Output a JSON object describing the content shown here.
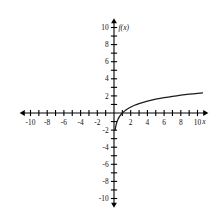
{
  "chart_data": {
    "type": "line",
    "title": "",
    "subtitle": "",
    "xlabel": "x",
    "ylabel": "f(x)",
    "function_label": "f(x)",
    "function_expression": "ln(x)",
    "xlim": [
      -10.8,
      10.8
    ],
    "ylim": [
      -10.6,
      10.6
    ],
    "grid": false,
    "legend": "none",
    "axis_arrows": [
      "left",
      "right",
      "up",
      "down"
    ],
    "tick_interval": 1,
    "label_interval": 2,
    "x_tick_values": [
      -10,
      -9,
      -8,
      -7,
      -6,
      -5,
      -4,
      -3,
      -2,
      -1,
      1,
      2,
      3,
      4,
      5,
      6,
      7,
      8,
      9,
      10
    ],
    "y_tick_values": [
      -10,
      -9,
      -8,
      -7,
      -6,
      -5,
      -4,
      -3,
      -2,
      -1,
      1,
      2,
      3,
      4,
      5,
      6,
      7,
      8,
      9,
      10
    ],
    "x_tick_labels": [
      {
        "value": -10,
        "text": "-10"
      },
      {
        "value": -8,
        "text": "-8"
      },
      {
        "value": -6,
        "text": "-6"
      },
      {
        "value": -4,
        "text": "-4"
      },
      {
        "value": -2,
        "text": "-2"
      },
      {
        "value": 2,
        "text": "2"
      },
      {
        "value": 4,
        "text": "4"
      },
      {
        "value": 6,
        "text": "6"
      },
      {
        "value": 8,
        "text": "8"
      },
      {
        "value": 10,
        "text": "10"
      }
    ],
    "y_tick_labels": [
      {
        "value": 10,
        "text": "10"
      },
      {
        "value": 8,
        "text": "8"
      },
      {
        "value": 6,
        "text": "6"
      },
      {
        "value": 4,
        "text": "4"
      },
      {
        "value": 2,
        "text": "2"
      },
      {
        "value": -2,
        "text": "-2"
      },
      {
        "value": -4,
        "text": "-4"
      },
      {
        "value": -6,
        "text": "-6"
      },
      {
        "value": -8,
        "text": "-8"
      },
      {
        "value": -10,
        "text": "-10"
      }
    ],
    "series": [
      {
        "name": "f(x) = ln(x)",
        "color": "#1a1a1a",
        "x": [
          0.135,
          0.16,
          0.2,
          0.25,
          0.32,
          0.4,
          0.5,
          0.65,
          0.8,
          1.0,
          1.25,
          1.5,
          1.8,
          2.2,
          2.6,
          3.0,
          3.5,
          4.0,
          4.5,
          5.0,
          5.5,
          6.0,
          6.5,
          7.0,
          7.5,
          8.0,
          8.5,
          9.0,
          9.5,
          10.0,
          10.6
        ],
        "y": [
          -2.0,
          -1.83,
          -1.61,
          -1.39,
          -1.14,
          -0.92,
          -0.69,
          -0.43,
          -0.22,
          0.0,
          0.22,
          0.41,
          0.59,
          0.79,
          0.96,
          1.1,
          1.25,
          1.39,
          1.5,
          1.61,
          1.7,
          1.79,
          1.87,
          1.95,
          2.01,
          2.08,
          2.14,
          2.2,
          2.25,
          2.3,
          2.36
        ]
      }
    ]
  }
}
